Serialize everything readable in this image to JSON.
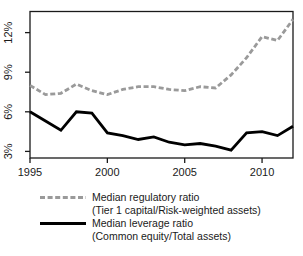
{
  "chart_data": {
    "type": "line",
    "x": [
      1995,
      1996,
      1997,
      1998,
      1999,
      2000,
      2001,
      2002,
      2003,
      2004,
      2005,
      2006,
      2007,
      2008,
      2009,
      2010,
      2011,
      2012
    ],
    "series": [
      {
        "name": "Median regulatory ratio",
        "subtitle": "(Tier 1 capital/Risk-weighted assets)",
        "line_style": "dashed",
        "color": "#9a9a9a",
        "values": [
          8.0,
          7.3,
          7.4,
          8.1,
          7.6,
          7.3,
          7.7,
          7.9,
          7.9,
          7.7,
          7.6,
          7.9,
          7.8,
          8.8,
          10.1,
          11.7,
          11.4,
          13.0
        ]
      },
      {
        "name": "Median leverage ratio",
        "subtitle": "(Common equity/Total assets)",
        "line_style": "solid",
        "color": "#000000",
        "values": [
          6.0,
          5.3,
          4.6,
          6.0,
          5.9,
          4.4,
          4.2,
          3.9,
          4.1,
          3.7,
          3.5,
          3.6,
          3.4,
          3.1,
          4.4,
          4.5,
          4.2,
          4.9
        ]
      }
    ],
    "xticks": {
      "values": [
        1995,
        2000,
        2005,
        2010
      ],
      "labels": [
        "1995",
        "2000",
        "2005",
        "2010"
      ]
    },
    "yticks": {
      "values": [
        3,
        6,
        9,
        12
      ],
      "labels": [
        "3%",
        "6%",
        "9%",
        "12%"
      ]
    },
    "xlim": [
      1995,
      2012
    ],
    "ylim": [
      2.5,
      13.6
    ],
    "grid": false,
    "legend_position": "bottom",
    "axis_color": "#1a1a1a"
  }
}
